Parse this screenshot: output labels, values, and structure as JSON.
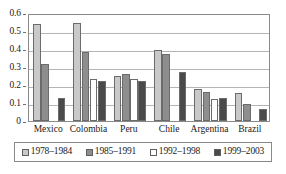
{
  "chart_data": {
    "type": "bar",
    "title": "",
    "subtitle": "",
    "xlabel": "",
    "ylabel": "",
    "ylim": [
      0,
      0.6
    ],
    "ytick_labels": [
      "0.6",
      "0.5",
      "0.4",
      "0.3",
      "0.2",
      "0.1",
      "0"
    ],
    "ytick_values": [
      0.6,
      0.5,
      0.4,
      0.3,
      0.2,
      0.1,
      0
    ],
    "grid": true,
    "legend_position": "bottom",
    "categories": [
      "Mexico",
      "Colombia",
      "Peru",
      "Chile",
      "Argentina",
      "Brazil"
    ],
    "series": [
      {
        "name": "1978–1984",
        "color": "#c9c9c9",
        "values": [
          0.538,
          0.545,
          0.252,
          0.395,
          0.178,
          0.155
        ]
      },
      {
        "name": "1985–1991",
        "color": "#8e8e8e",
        "values": [
          0.318,
          0.385,
          0.263,
          0.372,
          0.163,
          0.097
        ]
      },
      {
        "name": "1992–1998",
        "color": "#ffffff",
        "values": [
          0.0,
          0.235,
          0.233,
          0.0,
          0.12,
          0.0
        ]
      },
      {
        "name": "1999–2003",
        "color": "#4a4a4a",
        "values": [
          0.127,
          0.222,
          0.222,
          0.272,
          0.127,
          0.068
        ]
      }
    ]
  },
  "axes": {
    "y_labels": [
      "0.6",
      "0.5",
      "0.4",
      "0.3",
      "0.2",
      "0.1",
      "0"
    ],
    "x_labels": [
      "Mexico",
      "Colombia",
      "Peru",
      "Chile",
      "Argentina",
      "Brazil"
    ]
  },
  "legend": {
    "items": [
      {
        "label": "1978–1984",
        "color": "#c9c9c9"
      },
      {
        "label": "1985–1991",
        "color": "#8e8e8e"
      },
      {
        "label": "1992–1998",
        "color": "#ffffff"
      },
      {
        "label": "1999–2003",
        "color": "#4a4a4a"
      }
    ]
  }
}
